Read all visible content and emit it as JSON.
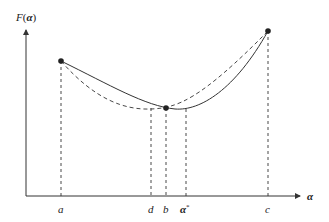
{
  "diagram": {
    "y_axis_label": "F(α)",
    "y_axis_label_parts": {
      "func": "F",
      "open": "(",
      "var": "α",
      "close": ")"
    },
    "x_axis_label": "α",
    "x_ticks": [
      {
        "id": "a",
        "label": "a",
        "x": 61
      },
      {
        "id": "d",
        "label": "d",
        "x": 151
      },
      {
        "id": "b",
        "label": "b",
        "x": 166
      },
      {
        "id": "alpha-star",
        "label": "α",
        "sup": "*",
        "x": 186
      },
      {
        "id": "c",
        "label": "c",
        "x": 268
      }
    ],
    "points": [
      {
        "id": "point-a",
        "x": 61,
        "y": 61
      },
      {
        "id": "point-b",
        "x": 166,
        "y": 108
      },
      {
        "id": "point-c",
        "x": 268,
        "y": 31
      }
    ],
    "curves": {
      "solid": "F(α) true function",
      "dashed": "quadratic interpolation"
    },
    "colors": {
      "line": "#333333",
      "point": "#222222",
      "text": "#222222"
    }
  }
}
